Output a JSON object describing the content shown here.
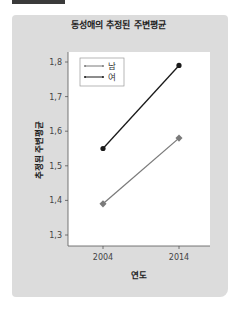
{
  "chart_data": {
    "type": "line",
    "title": "동성애의 추정된 주변평균",
    "xlabel": "연도",
    "ylabel": "추정된 주변평균",
    "categories": [
      "2004",
      "2014"
    ],
    "series": [
      {
        "name": "남",
        "values": [
          1.39,
          1.58
        ],
        "color": "#7a7a7a",
        "marker": "square"
      },
      {
        "name": "여",
        "values": [
          1.55,
          1.79
        ],
        "color": "#1a1a1a",
        "marker": "circle"
      }
    ],
    "yticks": [
      "1.3",
      "1.4",
      "1.5",
      "1.6",
      "1.7",
      "1.8"
    ],
    "ylim": [
      1.27,
      1.83
    ],
    "grid": false,
    "legend_position": "top-left"
  },
  "colors": {
    "panel_bg": "#dcdcdc",
    "plot_bg": "#ffffff",
    "header_bar": "#3a3a3a"
  }
}
